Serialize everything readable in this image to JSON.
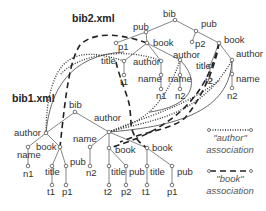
{
  "titles": {
    "bib2": "bib2.xml",
    "bib1": "bib1.xml"
  },
  "bib2_tree": {
    "bib": "bib",
    "pub_left": "pub",
    "p1": "p1",
    "book_left": "book",
    "title_left": "title",
    "t1": "t1",
    "author_a": "author",
    "name_a": "name",
    "n1": "n1",
    "author_b": "author",
    "name_b": "name",
    "n2_b": "n2",
    "pub_right": "pub",
    "p2": "p2",
    "book_right": "book",
    "title_right": "title",
    "t2": "t2",
    "author_c": "author",
    "name_c": "name",
    "n2_c": "n2"
  },
  "bib1_tree": {
    "bib": "bib",
    "author_left": "author",
    "name_left": "name",
    "n1": "n1",
    "book_left": "book",
    "title_left": "title",
    "t1_left": "t1",
    "pub_left": "pub",
    "p1_left": "p1",
    "author_right": "author",
    "name_right": "name",
    "n2": "n2",
    "book_mid": "book",
    "title_mid": "title",
    "t2": "t2",
    "pub_mid": "pub",
    "p2": "p2",
    "book_right": "book",
    "title_right": "title",
    "t1_right": "t1",
    "pub_right": "pub",
    "p1_right": "p1"
  },
  "legend": {
    "author_line1": "\"author\"",
    "author_line2": "association",
    "book_line1": "\"book\"",
    "book_line2": "association"
  },
  "colors": {
    "edge": "#666666",
    "text": "#333333",
    "association": "#222222"
  }
}
